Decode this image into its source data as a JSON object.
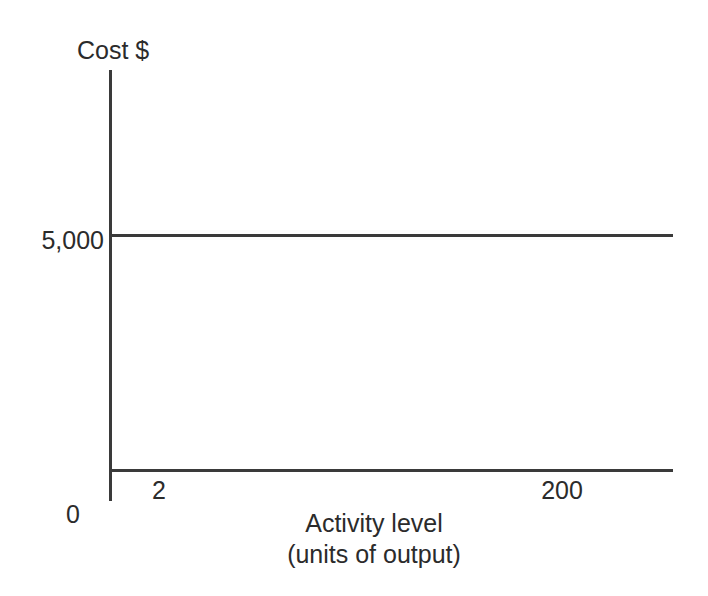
{
  "chart_data": {
    "type": "line",
    "title": "",
    "subtitle": "",
    "xlabel_line1": "Activity level",
    "xlabel_line2": "(units of output)",
    "ylabel": "Cost $",
    "x": [
      2,
      200
    ],
    "xticklabels": [
      "2",
      "200"
    ],
    "origin_label": "0",
    "yticklabels": [
      "5,000"
    ],
    "yticks": [
      5000
    ],
    "ylim": [
      0,
      10000
    ],
    "xlim": [
      0,
      230
    ],
    "grid": false,
    "legend": false,
    "legend_position": "none",
    "series": [
      {
        "name": "Fixed cost",
        "values": [
          5000,
          5000
        ],
        "color": "#3a3a3a"
      }
    ],
    "annotations": []
  },
  "style": {
    "line_color": "#3a3a3a",
    "axis_color": "#3a3a3a",
    "text_color": "#2b2b2b",
    "background": "#ffffff"
  }
}
